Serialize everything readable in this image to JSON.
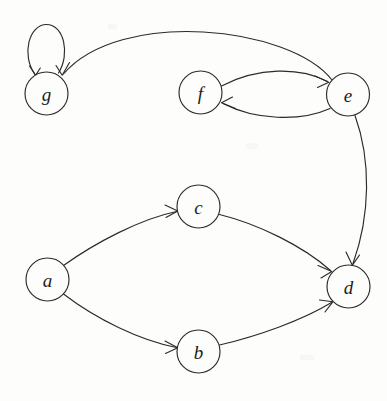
{
  "figure": {
    "name": "directed-graph",
    "width": 387,
    "height": 401,
    "background_color": "#fdfdfc",
    "ink_color": "#2b2b2b",
    "node_radius": 21.5,
    "node_fill": "#fdfdfc"
  },
  "nodes": [
    {
      "id": "g",
      "label": "g",
      "cx": 46.5,
      "cy": 93.5,
      "r": 21.5
    },
    {
      "id": "f",
      "label": "f",
      "cx": 200.5,
      "cy": 92.5,
      "r": 21.5
    },
    {
      "id": "e",
      "label": "e",
      "cx": 348.0,
      "cy": 94.5,
      "r": 21.5
    },
    {
      "id": "c",
      "label": "c",
      "cx": 198.5,
      "cy": 206.5,
      "r": 21.5
    },
    {
      "id": "a",
      "label": "a",
      "cx": 47.5,
      "cy": 279.5,
      "r": 21.5
    },
    {
      "id": "d",
      "label": "d",
      "cx": 348.5,
      "cy": 286.5,
      "r": 21.5
    },
    {
      "id": "b",
      "label": "b",
      "cx": 198.5,
      "cy": 351.5,
      "r": 21.5
    }
  ],
  "edges": [
    {
      "id": "g-g",
      "from": "g",
      "to": "g",
      "kind": "self-loop",
      "path": "M 35.0 74.5 C 21.0 55.0 29.0 24.5 46.5 24.5 C 64.0 24.5 70.5 54.0 58.5 73.0",
      "arrow": "M 29.5 66.0 L 35.6 75.3 L 40.3 68.0"
    },
    {
      "id": "e-g",
      "from": "e",
      "to": "g",
      "kind": "arc",
      "path": "M 332.0 80.0 C 290.0 26.0 120.0 8.0 63.5 74.0",
      "arrow": "M 69.5 62.5 L 62.2 75.2 L 56.0 65.5"
    },
    {
      "id": "f-e",
      "from": "f",
      "to": "e",
      "kind": "arc",
      "path": "M 221.5 86.0 C 258.0 67.0 300.0 67.0 327.5 81.5",
      "arrow": "M 315.0 76.0 L 328.8 82.3 L 317.5 87.5"
    },
    {
      "id": "e-f",
      "from": "e",
      "to": "f",
      "kind": "arc",
      "path": "M 330.0 108.5 C 300.0 122.0 255.0 120.0 223.0 103.5",
      "arrow": "M 235.5 108.5 L 221.5 102.7 L 232.5 97.0"
    },
    {
      "id": "e-d",
      "from": "e",
      "to": "d",
      "kind": "curve",
      "path": "M 355.0 115.5 C 371.0 160.0 370.5 215.0 353.0 263.5",
      "arrow": "M 346.0 252.0 L 352.3 265.3 L 359.5 255.0"
    },
    {
      "id": "a-c",
      "from": "a",
      "to": "c",
      "kind": "curve",
      "path": "M 63.5 265.5 C 95.0 243.0 140.0 219.0 176.5 211.5",
      "arrow": "M 165.0 205.0 L 177.8 211.0 L 166.0 217.5"
    },
    {
      "id": "c-d",
      "from": "c",
      "to": "d",
      "kind": "curve",
      "path": "M 219.5 214.5 C 258.0 224.0 303.0 246.0 330.5 270.5",
      "arrow": "M 318.0 265.5 L 331.8 271.5 L 321.0 278.0"
    },
    {
      "id": "a-b",
      "from": "a",
      "to": "b",
      "kind": "curve",
      "path": "M 63.5 294.0 C 96.0 319.0 140.0 340.5 176.5 347.5",
      "arrow": "M 165.0 341.0 L 177.8 347.8 L 165.5 353.5"
    },
    {
      "id": "b-d",
      "from": "b",
      "to": "d",
      "kind": "curve",
      "path": "M 219.5 345.0 C 258.0 336.0 303.0 320.0 331.5 302.5",
      "arrow": "M 319.5 300.0 L 332.8 301.8 L 325.0 312.0"
    }
  ]
}
